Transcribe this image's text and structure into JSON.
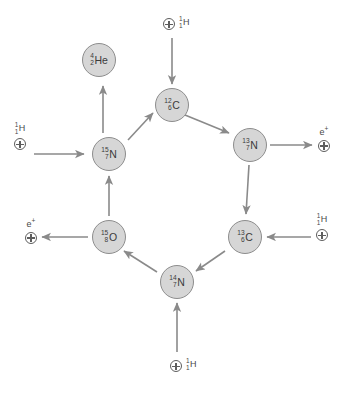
{
  "diagram": {
    "type": "cycle-diagram",
    "colors": {
      "node_fill": "#d6d6d6",
      "node_border": "#8d8d8d",
      "arrow": "#8a8a8a",
      "text": "#3b3b3b",
      "background": "#ffffff"
    }
  },
  "nodes": [
    {
      "id": "c12",
      "mass": "12",
      "atomic": "6",
      "symbol": "C",
      "label": "12 6 C",
      "x": 155,
      "y": 88
    },
    {
      "id": "n13",
      "mass": "13",
      "atomic": "7",
      "symbol": "N",
      "label": "13 7 N",
      "x": 233,
      "y": 128
    },
    {
      "id": "c13",
      "mass": "13",
      "atomic": "6",
      "symbol": "C",
      "label": "13 6 C",
      "x": 228,
      "y": 220
    },
    {
      "id": "n14",
      "mass": "14",
      "atomic": "7",
      "symbol": "N",
      "label": "14 7 N",
      "x": 160,
      "y": 265
    },
    {
      "id": "o15",
      "mass": "15",
      "atomic": "8",
      "symbol": "O",
      "label": "15 8 O",
      "x": 92,
      "y": 220
    },
    {
      "id": "n15",
      "mass": "15",
      "atomic": "7",
      "symbol": "N",
      "label": "15 7 N",
      "x": 92,
      "y": 137
    },
    {
      "id": "he4",
      "mass": "4",
      "atomic": "2",
      "symbol": "He",
      "label": "4 2 He",
      "x": 82,
      "y": 43
    }
  ],
  "particles": [
    {
      "id": "proton-top",
      "kind": "proton",
      "glyph": "circled-plus",
      "mass": "1",
      "atomic": "1",
      "symbol": "H",
      "layout": "row",
      "x": 163,
      "y": 16
    },
    {
      "id": "proton-left",
      "kind": "proton",
      "glyph": "circled-plus",
      "mass": "1",
      "atomic": "1",
      "symbol": "H",
      "layout": "stack",
      "x": 14,
      "y": 122
    },
    {
      "id": "proton-right",
      "kind": "proton",
      "glyph": "circled-plus",
      "mass": "1",
      "atomic": "1",
      "symbol": "H",
      "layout": "stack",
      "x": 316,
      "y": 213
    },
    {
      "id": "proton-bottom",
      "kind": "proton",
      "glyph": "circled-plus",
      "mass": "1",
      "atomic": "1",
      "symbol": "H",
      "layout": "row",
      "x": 170,
      "y": 358
    },
    {
      "id": "positron-right",
      "kind": "positron",
      "glyph": "circled-plus",
      "label": "e",
      "charge": "+",
      "layout": "stack",
      "x": 318,
      "y": 126
    },
    {
      "id": "positron-left",
      "kind": "positron",
      "glyph": "circled-plus",
      "label": "e",
      "charge": "+",
      "layout": "stack",
      "x": 25,
      "y": 218
    }
  ],
  "reactions": [
    {
      "from": "proton-top",
      "to": "c12",
      "kind": "capture"
    },
    {
      "from": "c12",
      "to": "n13",
      "kind": "cycle"
    },
    {
      "from": "n13",
      "to": "positron-right",
      "kind": "decay"
    },
    {
      "from": "n13",
      "to": "c13",
      "kind": "cycle"
    },
    {
      "from": "proton-right",
      "to": "c13",
      "kind": "capture"
    },
    {
      "from": "c13",
      "to": "n14",
      "kind": "cycle"
    },
    {
      "from": "proton-bottom",
      "to": "n14",
      "kind": "capture"
    },
    {
      "from": "n14",
      "to": "o15",
      "kind": "cycle"
    },
    {
      "from": "o15",
      "to": "positron-left",
      "kind": "decay"
    },
    {
      "from": "o15",
      "to": "n15",
      "kind": "cycle"
    },
    {
      "from": "proton-left",
      "to": "n15",
      "kind": "capture"
    },
    {
      "from": "n15",
      "to": "c12",
      "kind": "cycle"
    },
    {
      "from": "n15",
      "to": "he4",
      "kind": "emission"
    }
  ]
}
